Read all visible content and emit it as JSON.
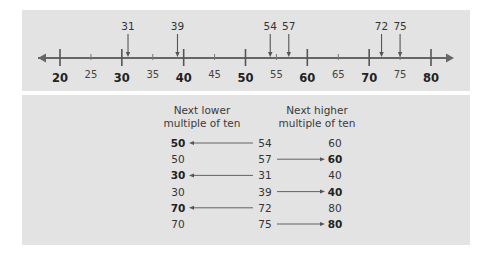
{
  "number_line": {
    "min": 20,
    "max": 80,
    "major_ticks": [
      "20",
      "30",
      "40",
      "50",
      "60",
      "70",
      "80"
    ],
    "minor_ticks": [
      "25",
      "35",
      "45",
      "55",
      "65",
      "75"
    ],
    "marked_points": [
      "31",
      "39",
      "54",
      "57",
      "72",
      "75"
    ]
  },
  "table": {
    "header_lower": "Next lower multiple of ten",
    "header_lower_line1": "Next lower",
    "header_lower_line2": "multiple of ten",
    "header_higher_line1": "Next higher",
    "header_higher_line2": "multiple of ten",
    "rows": [
      {
        "lower": "50",
        "number": "54",
        "higher": "60",
        "rounds_to": "lower"
      },
      {
        "lower": "50",
        "number": "57",
        "higher": "60",
        "rounds_to": "higher"
      },
      {
        "lower": "30",
        "number": "31",
        "higher": "40",
        "rounds_to": "lower"
      },
      {
        "lower": "30",
        "number": "39",
        "higher": "40",
        "rounds_to": "higher"
      },
      {
        "lower": "70",
        "number": "72",
        "higher": "80",
        "rounds_to": "lower"
      },
      {
        "lower": "70",
        "number": "75",
        "higher": "80",
        "rounds_to": "higher"
      }
    ]
  },
  "colors": {
    "panel": "#e3e3e3",
    "line": "#666666",
    "text": "#333333"
  }
}
